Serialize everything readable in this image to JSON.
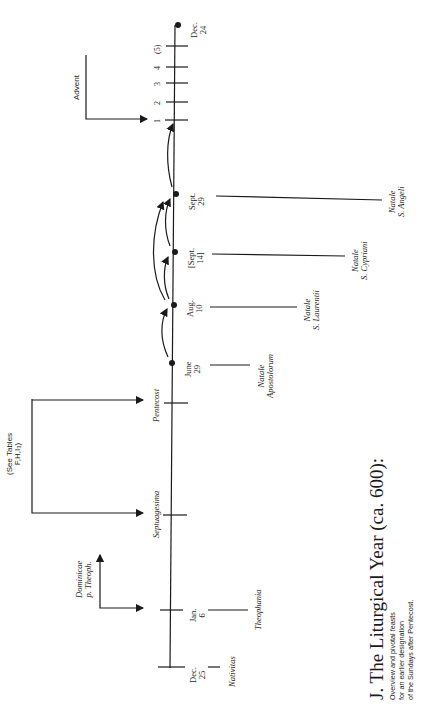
{
  "figure": {
    "title": "J. The Liturgical Year (ca. 600):",
    "subtitle_lines": [
      "Overview and pivotal feasts",
      "for an earlier designation",
      "of the Sundays after Pentecost."
    ]
  },
  "timeline": {
    "dates": {
      "dec25": [
        "Dec.",
        "25"
      ],
      "jan6": [
        "Jan.",
        "6"
      ],
      "june29": [
        "June",
        "29"
      ],
      "aug10": [
        "Aug.",
        "10"
      ],
      "sept14": [
        "[Sept.",
        "14]"
      ],
      "sept29": [
        "Sept.",
        "29"
      ],
      "dec24": [
        "Dec.",
        "24"
      ]
    },
    "movable_feasts": {
      "septuagesima": "Septuagesima",
      "pentecost": "Pentecost"
    },
    "advent_sundays": [
      "1",
      "2",
      "3",
      "4",
      "(5)"
    ]
  },
  "feasts": {
    "nativitas": "Nativitas",
    "theophania": "Theophania",
    "apostolorum": [
      "Natale",
      "Apostolorum"
    ],
    "laurentii": [
      "Natale",
      "S. Laurentii"
    ],
    "cypriani": [
      "Natale",
      "S. Cypriani"
    ],
    "angeli": [
      "Natale",
      "S. Angeli"
    ]
  },
  "annotations": {
    "dominicae": [
      "Dominicae",
      "p. Theoph."
    ],
    "see_tables": [
      "(See Tables",
      "F,H,I₃)"
    ],
    "advent": "Advent"
  },
  "colors": {
    "ink": "#1a1a1a",
    "paper": "#ffffff"
  }
}
